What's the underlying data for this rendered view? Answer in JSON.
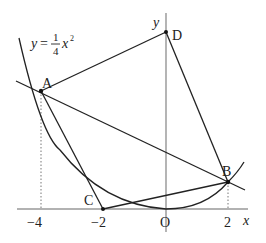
{
  "diagram": {
    "curve_label": {
      "y": "y",
      "eq": "=",
      "num": "1",
      "den": "4",
      "x": "x",
      "exp": "2"
    },
    "axes": {
      "x_label": "x",
      "y_label": "y",
      "origin_label": "O"
    },
    "ticks": {
      "neg4": "−4",
      "neg2": "−2",
      "pos2": "2"
    },
    "points": {
      "A": {
        "label": "A",
        "coords": [
          -4,
          4
        ]
      },
      "B": {
        "label": "B",
        "coords": [
          2,
          1
        ]
      },
      "C": {
        "label": "C",
        "coords": [
          -2,
          0
        ]
      },
      "D": {
        "label": "D",
        "coords": [
          0,
          6
        ]
      }
    },
    "colors": {
      "line": "#222222",
      "axis": "#666666",
      "dotted": "#777777"
    }
  }
}
